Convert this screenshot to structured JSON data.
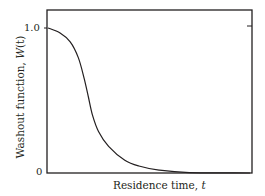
{
  "chart_data": {
    "type": "line",
    "title": "",
    "xlabel": "Residence time, t",
    "xlabel_parts": {
      "text": "Residence time, ",
      "var": "t"
    },
    "ylabel": "Washout function, W(t)",
    "ylabel_parts": {
      "text": "Washout function, ",
      "var": "W",
      "arg": "(t)"
    },
    "y_ticks": [
      "0",
      "1.0"
    ],
    "x_ticks": [],
    "ylim": [
      0,
      1.1
    ],
    "xlim": [
      0,
      1
    ],
    "grid": false,
    "legend": null,
    "series": [
      {
        "name": "W(t)",
        "x": [
          0.0,
          0.06,
          0.11,
          0.15,
          0.18,
          0.2,
          0.22,
          0.25,
          0.3,
          0.38,
          0.45,
          0.55,
          0.7,
          1.0
        ],
        "values": [
          1.0,
          0.966,
          0.905,
          0.796,
          0.646,
          0.524,
          0.401,
          0.286,
          0.184,
          0.088,
          0.048,
          0.02,
          0.003,
          0.0
        ]
      }
    ]
  },
  "frame": {
    "left": 47,
    "top": 10,
    "right": 252,
    "bottom": 173
  },
  "plot": {
    "x0": 48,
    "x1": 250,
    "y0": 173,
    "y1": 28
  },
  "colors": {
    "axis": "#231f20",
    "line": "#231f20",
    "background": "#ffffff"
  }
}
